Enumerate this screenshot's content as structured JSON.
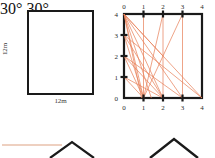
{
  "page": {
    "background_color": "#ffffff",
    "ink_color": "#1a1a1a",
    "accent_color": "#e8815a"
  },
  "figures": [
    {
      "id": "square",
      "type": "labelled-square",
      "shape": "square",
      "side_label_bottom": "12m",
      "side_label_left": "12m",
      "stroke_color": "#1a1a1a"
    },
    {
      "id": "grid",
      "type": "coordinate-grid-with-segments",
      "stroke_color": "#1a1a1a",
      "segment_color": "#e8815a"
    },
    {
      "id": "roof-labeled",
      "type": "roof-angle-diagram",
      "angle_left": "30°",
      "angle_right": "30°",
      "stroke_color": "#1a1a1a",
      "guide_color": "#e9c0ab"
    },
    {
      "id": "roof-plain",
      "type": "roof-outline",
      "stroke_color": "#1a1a1a"
    }
  ],
  "chart_data": {
    "type": "scatter",
    "title": "",
    "xlabel": "",
    "ylabel": "",
    "xlim": [
      0,
      4
    ],
    "ylim": [
      0,
      4
    ],
    "grid": false,
    "axis_box": true,
    "ticks_all_sides": true,
    "x_ticks": [
      0,
      1,
      2,
      3,
      4
    ],
    "y_ticks": [
      0,
      1,
      2,
      3,
      4
    ],
    "x_tick_labels_bottom": [
      "0",
      "1",
      "2",
      "3",
      "4"
    ],
    "x_tick_labels_top": [
      "0",
      "1",
      "2",
      "3",
      "4"
    ],
    "y_tick_labels_left": [
      "0",
      "1",
      "2",
      "3",
      "4"
    ],
    "segment_color": "#e8815a",
    "segments": [
      {
        "x1": 0,
        "y1": 4,
        "x2": 1,
        "y2": 0
      },
      {
        "x1": 0,
        "y1": 4,
        "x2": 2,
        "y2": 0
      },
      {
        "x1": 0,
        "y1": 4,
        "x2": 3,
        "y2": 0
      },
      {
        "x1": 0,
        "y1": 4,
        "x2": 4,
        "y2": 0
      },
      {
        "x1": 0,
        "y1": 4,
        "x2": 1.4,
        "y2": 0
      },
      {
        "x1": 0,
        "y1": 4,
        "x2": 0.9,
        "y2": 0
      },
      {
        "x1": 0,
        "y1": 3,
        "x2": 1,
        "y2": 0
      },
      {
        "x1": 0,
        "y1": 3,
        "x2": 2,
        "y2": 0
      },
      {
        "x1": 0,
        "y1": 2,
        "x2": 1,
        "y2": 0
      },
      {
        "x1": 0,
        "y1": 2,
        "x2": 2,
        "y2": 0
      },
      {
        "x1": 0,
        "y1": 2,
        "x2": 3,
        "y2": 0
      },
      {
        "x1": 0,
        "y1": 1,
        "x2": 1,
        "y2": 0
      },
      {
        "x1": 0,
        "y1": 1,
        "x2": 2,
        "y2": 0
      },
      {
        "x1": 1,
        "y1": 4,
        "x2": 1,
        "y2": 0
      },
      {
        "x1": 2,
        "y1": 4,
        "x2": 1,
        "y2": 0
      },
      {
        "x1": 2,
        "y1": 4,
        "x2": 2,
        "y2": 0
      },
      {
        "x1": 3,
        "y1": 4,
        "x2": 1,
        "y2": 0
      },
      {
        "x1": 3,
        "y1": 4,
        "x2": 3,
        "y2": 0
      },
      {
        "x1": 0,
        "y1": 4,
        "x2": 2,
        "y2": 2
      },
      {
        "x1": 0,
        "y1": 3,
        "x2": 4,
        "y2": 0
      }
    ],
    "markers": [
      {
        "x": 0,
        "y": 4
      },
      {
        "x": 1,
        "y": 4
      },
      {
        "x": 2,
        "y": 4
      },
      {
        "x": 3,
        "y": 4
      },
      {
        "x": 0,
        "y": 3
      },
      {
        "x": 0,
        "y": 2
      },
      {
        "x": 0,
        "y": 1
      },
      {
        "x": 0,
        "y": 0
      },
      {
        "x": 1,
        "y": 0
      },
      {
        "x": 2,
        "y": 0
      },
      {
        "x": 3,
        "y": 0
      }
    ]
  }
}
